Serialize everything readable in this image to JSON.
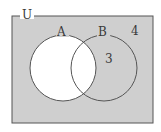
{
  "diagram": {
    "type": "venn",
    "universe_label": "U",
    "sets": [
      {
        "label": "A",
        "filled": false
      },
      {
        "label": "B",
        "filled": true
      }
    ],
    "region_values": {
      "B_only": "3",
      "outside": "4"
    },
    "colors": {
      "shaded": "#cfcfcf",
      "unshaded": "#ffffff",
      "stroke": "#555555"
    }
  }
}
